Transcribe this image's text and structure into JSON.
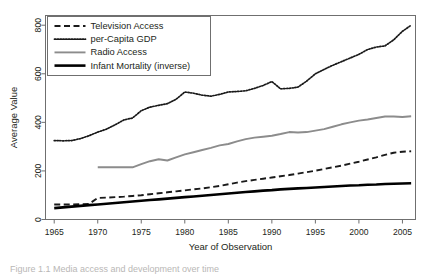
{
  "figure": {
    "caption": "Figure 1.1 Media access and development over time"
  },
  "chart_data": {
    "type": "line",
    "title": "",
    "xlabel": "Year of Observation",
    "ylabel": "Average Value",
    "xlim": [
      1964,
      2006.5
    ],
    "ylim": [
      0,
      840
    ],
    "xticks": [
      1965,
      1970,
      1975,
      1980,
      1985,
      1990,
      1995,
      2000,
      2005
    ],
    "yticks": [
      0,
      200,
      400,
      600,
      800
    ],
    "xtick_labels": [
      "1965",
      "1970",
      "1975",
      "1980",
      "1985",
      "1990",
      "1995",
      "2000",
      "2005"
    ],
    "ytick_labels": [
      "0",
      "200",
      "400",
      "600",
      "800"
    ],
    "grid": false,
    "legend_position": "top-left",
    "series": [
      {
        "name": "Television Access",
        "style": "dashed",
        "color": "#1a1a1a",
        "width": 1.9,
        "x": [
          1965,
          1966,
          1967,
          1968,
          1969,
          1970,
          1971,
          1972,
          1973,
          1974,
          1975,
          1976,
          1977,
          1978,
          1979,
          1980,
          1981,
          1982,
          1983,
          1984,
          1985,
          1986,
          1987,
          1988,
          1989,
          1990,
          1991,
          1992,
          1993,
          1994,
          1995,
          1996,
          1997,
          1998,
          1999,
          2000,
          2001,
          2002,
          2003,
          2004,
          2005,
          2006
        ],
        "y": [
          62,
          62,
          62,
          63,
          64,
          89,
          90,
          92,
          94,
          97,
          100,
          104,
          108,
          112,
          116,
          120,
          124,
          128,
          133,
          138,
          145,
          152,
          158,
          163,
          168,
          173,
          178,
          183,
          189,
          195,
          201,
          208,
          215,
          222,
          230,
          238,
          247,
          256,
          266,
          275,
          279,
          281
        ]
      },
      {
        "name": "per-Capita GDP",
        "style": "dotted",
        "color": "#1a1a1a",
        "width": 1.7,
        "x": [
          1965,
          1966,
          1967,
          1968,
          1969,
          1970,
          1971,
          1972,
          1973,
          1974,
          1975,
          1976,
          1977,
          1978,
          1979,
          1980,
          1981,
          1982,
          1983,
          1984,
          1985,
          1986,
          1987,
          1988,
          1989,
          1990,
          1991,
          1992,
          1993,
          1994,
          1995,
          1996,
          1997,
          1998,
          1999,
          2000,
          2001,
          2002,
          2003,
          2004,
          2005,
          2006
        ],
        "y": [
          325,
          324,
          325,
          333,
          345,
          360,
          372,
          390,
          410,
          418,
          448,
          463,
          470,
          477,
          495,
          525,
          520,
          512,
          508,
          515,
          525,
          527,
          530,
          540,
          552,
          568,
          538,
          540,
          545,
          570,
          600,
          618,
          635,
          650,
          665,
          680,
          700,
          710,
          715,
          740,
          775,
          800
        ]
      },
      {
        "name": "Radio Access",
        "style": "solid",
        "color": "#8c8c8c",
        "width": 1.9,
        "x": [
          1970,
          1971,
          1972,
          1973,
          1974,
          1975,
          1976,
          1977,
          1978,
          1979,
          1980,
          1981,
          1982,
          1983,
          1984,
          1985,
          1986,
          1987,
          1988,
          1989,
          1990,
          1991,
          1992,
          1993,
          1994,
          1995,
          1996,
          1997,
          1998,
          1999,
          2000,
          2001,
          2002,
          2003,
          2004,
          2005,
          2006
        ],
        "y": [
          215,
          215,
          215,
          215,
          215,
          228,
          240,
          248,
          243,
          256,
          268,
          277,
          286,
          295,
          305,
          311,
          322,
          331,
          337,
          341,
          345,
          352,
          360,
          358,
          360,
          366,
          372,
          382,
          392,
          400,
          407,
          412,
          418,
          424,
          424,
          422,
          425
        ]
      },
      {
        "name": "Infant Mortality (inverse)",
        "style": "solid",
        "color": "#000000",
        "width": 2.6,
        "x": [
          1965,
          1966,
          1967,
          1968,
          1969,
          1970,
          1971,
          1972,
          1973,
          1974,
          1975,
          1976,
          1977,
          1978,
          1979,
          1980,
          1981,
          1982,
          1983,
          1984,
          1985,
          1986,
          1987,
          1988,
          1989,
          1990,
          1991,
          1992,
          1993,
          1994,
          1995,
          1996,
          1997,
          1998,
          1999,
          2000,
          2001,
          2002,
          2003,
          2004,
          2005,
          2006
        ],
        "y": [
          47,
          50,
          53,
          56,
          59,
          62,
          65,
          68,
          71,
          74,
          77,
          80,
          83,
          86,
          89,
          92,
          95,
          98,
          101,
          104,
          107,
          110,
          113,
          116,
          119,
          121,
          124,
          126,
          128,
          130,
          132,
          134,
          136,
          138,
          140,
          141,
          143,
          144,
          146,
          147,
          148,
          149
        ]
      }
    ]
  },
  "legend": {
    "items": [
      {
        "label": "Television Access"
      },
      {
        "label": "per-Capita GDP"
      },
      {
        "label": "Radio Access"
      },
      {
        "label": "Infant Mortality (inverse)"
      }
    ]
  }
}
